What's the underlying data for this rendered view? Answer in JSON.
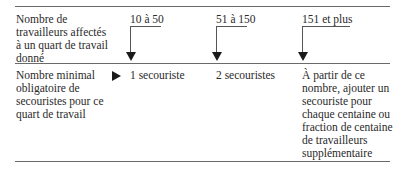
{
  "header_label": [
    "Nombre de",
    "travailleurs affectés",
    "à un quart de travail",
    "donné"
  ],
  "ranges": [
    "10 à 50",
    "51 à 150",
    "151 et plus"
  ],
  "result_label": [
    "Nombre minimal",
    "obligatoire de",
    "secouristes pour ce",
    "quart de travail"
  ],
  "results": {
    "r1": "1 secouriste",
    "r2": "2 secouristes",
    "r3": [
      "À partir de ce",
      "nombre, ajouter un",
      "secouriste pour",
      "chaque centaine ou",
      "fraction de centaine",
      "de travailleurs",
      "supplémentaire"
    ]
  }
}
